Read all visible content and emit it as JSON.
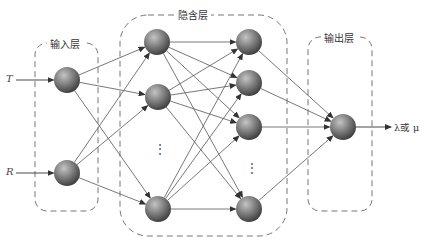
{
  "layers": {
    "input": {
      "label": "输入层"
    },
    "hidden": {
      "label": "隐含层"
    },
    "output": {
      "label": "输出层"
    }
  },
  "inputs": [
    {
      "symbol": "T"
    },
    {
      "symbol": "R"
    }
  ],
  "output_symbol": "λ或 μ",
  "ellipsis_hidden1": "⋮",
  "ellipsis_hidden2": "⋮",
  "colors": {
    "node_light": "#b8b8b8",
    "node_dark": "#4a4a4a",
    "edge": "#555555",
    "border": "#777777"
  },
  "nodes": {
    "input": [
      [
        67,
        80
      ],
      [
        67,
        173
      ]
    ],
    "hidden1": [
      [
        157,
        42
      ],
      [
        158,
        97
      ],
      [
        158,
        209
      ]
    ],
    "hidden2": [
      [
        249,
        42
      ],
      [
        249,
        83
      ],
      [
        249,
        127
      ],
      [
        249,
        209
      ]
    ],
    "output": [
      [
        343,
        127
      ]
    ]
  }
}
